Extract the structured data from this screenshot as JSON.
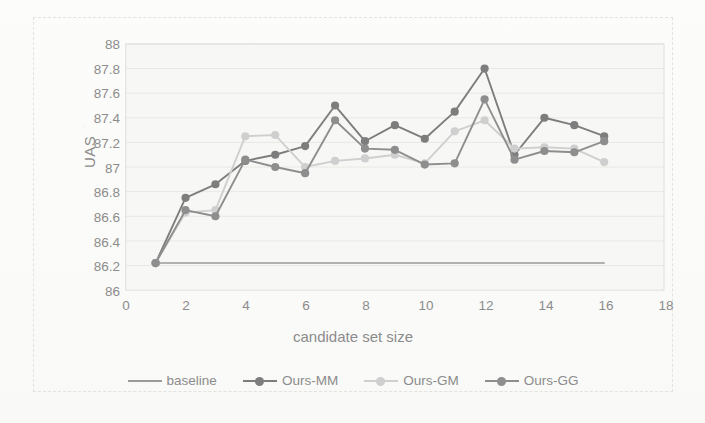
{
  "chart_data": {
    "type": "line",
    "title": "",
    "xlabel": "candidate set size",
    "ylabel": "UAS",
    "xlim": [
      0,
      18
    ],
    "ylim": [
      86,
      88
    ],
    "xticks": [
      0,
      2,
      4,
      6,
      8,
      10,
      12,
      14,
      16,
      18
    ],
    "yticks": [
      "86",
      "86.2",
      "86.4",
      "86.6",
      "86.8",
      "87",
      "87.2",
      "87.4",
      "87.6",
      "87.8",
      "88"
    ],
    "grid": true,
    "legend_position": "bottom",
    "x": [
      1,
      2,
      3,
      4,
      5,
      6,
      7,
      8,
      9,
      10,
      11,
      12,
      13,
      14,
      15,
      16
    ],
    "series": [
      {
        "name": "baseline",
        "color": "#9a9a9a",
        "marker": false,
        "values": [
          86.22,
          86.22,
          86.22,
          86.22,
          86.22,
          86.22,
          86.22,
          86.22,
          86.22,
          86.22,
          86.22,
          86.22,
          86.22,
          86.22,
          86.22,
          86.22
        ]
      },
      {
        "name": "Ours-MM",
        "color": "#7d7d7d",
        "marker": true,
        "values": [
          86.22,
          86.75,
          86.86,
          87.05,
          87.1,
          87.17,
          87.5,
          87.21,
          87.34,
          87.23,
          87.45,
          87.8,
          87.1,
          87.4,
          87.34,
          87.25
        ]
      },
      {
        "name": "Ours-GM",
        "color": "#cfcfcf",
        "marker": true,
        "values": [
          86.22,
          86.63,
          86.65,
          87.25,
          87.26,
          87.0,
          87.05,
          87.07,
          87.1,
          87.03,
          87.29,
          87.38,
          87.15,
          87.16,
          87.15,
          87.04
        ]
      },
      {
        "name": "Ours-GG",
        "color": "#8e8e8e",
        "marker": true,
        "values": [
          86.22,
          86.65,
          86.6,
          87.06,
          87.0,
          86.95,
          87.38,
          87.15,
          87.14,
          87.02,
          87.03,
          87.55,
          87.06,
          87.13,
          87.12,
          87.21
        ]
      }
    ]
  },
  "axes": {
    "ylabel": "UAS",
    "xlabel": "candidate set size"
  },
  "legend": {
    "items": [
      {
        "label": "baseline"
      },
      {
        "label": "Ours-MM"
      },
      {
        "label": "Ours-GM"
      },
      {
        "label": "Ours-GG"
      }
    ]
  },
  "colors": {
    "baseline": "#9a9a9a",
    "ours_mm": "#7d7d7d",
    "ours_gm": "#cfcfcf",
    "ours_gg": "#8e8e8e",
    "grid": "#e8e8e4",
    "text": "#8c8c8c",
    "plot_bg": "#f7f7f5"
  }
}
